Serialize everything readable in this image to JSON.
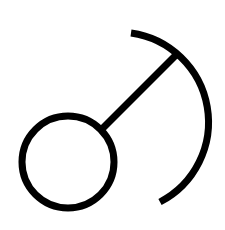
{
  "symbol": {
    "name": "ball-and-stick-arc-symbol",
    "stroke_color": "#000000",
    "background_color": "#ffffff",
    "stroke_width": 7,
    "circle": {
      "cx": 68,
      "cy": 162,
      "r": 46
    },
    "stick": {
      "x1": 103,
      "y1": 128,
      "x2": 176,
      "y2": 55
    },
    "arc": {
      "start": [
        131,
        33
      ],
      "end": [
        160,
        202
      ],
      "radius": 90
    }
  }
}
